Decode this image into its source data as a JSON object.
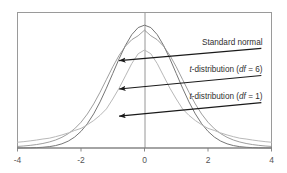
{
  "figure": {
    "title": "",
    "background_color": "#ffffff",
    "frame_color": "#9a9a9a"
  },
  "axis": {
    "x_tick_labels": [
      "-4",
      "-2",
      "0",
      "2",
      "4"
    ],
    "x_tick_values": [
      -4,
      -2,
      0,
      2,
      4
    ],
    "x_label": "",
    "y_label": "",
    "y_ticks_shown": false
  },
  "annotations": [
    {
      "id": "standard-normal",
      "text_parts": [
        {
          "text": "Standard normal",
          "italic": false
        }
      ],
      "plain_text": "Standard normal",
      "arrow_from": [
        0.96,
        0.735
      ],
      "arrow_to": [
        0.4,
        0.645
      ]
    },
    {
      "id": "t-df-6",
      "text_parts": [
        {
          "text": "t",
          "italic": true
        },
        {
          "text": "-distribution (",
          "italic": false
        },
        {
          "text": "df",
          "italic": true
        },
        {
          "text": " = 6)",
          "italic": false
        }
      ],
      "plain_text": "t-distribution (df = 6)",
      "arrow_from": [
        0.96,
        0.535
      ],
      "arrow_to": [
        0.4,
        0.435
      ]
    },
    {
      "id": "t-df-1",
      "text_parts": [
        {
          "text": "t",
          "italic": true
        },
        {
          "text": "-distribution (",
          "italic": false
        },
        {
          "text": "df",
          "italic": true
        },
        {
          "text": " = 1)",
          "italic": false
        }
      ],
      "plain_text": "t-distribution (df = 1)",
      "arrow_from": [
        0.96,
        0.335
      ],
      "arrow_to": [
        0.4,
        0.235
      ]
    }
  ],
  "chart_data": {
    "type": "line",
    "title": "",
    "xlabel": "",
    "ylabel": "",
    "xlim": [
      -4,
      4
    ],
    "ylim": [
      0,
      0.44
    ],
    "grid": false,
    "legend_position": "inline-annotations",
    "x": [
      -4,
      -3.8,
      -3.6,
      -3.4,
      -3.2,
      -3,
      -2.8,
      -2.6,
      -2.4,
      -2.2,
      -2,
      -1.8,
      -1.6,
      -1.4,
      -1.2,
      -1,
      -0.8,
      -0.6,
      -0.4,
      -0.2,
      0,
      0.2,
      0.4,
      0.6,
      0.8,
      1,
      1.2,
      1.4,
      1.6,
      1.8,
      2,
      2.2,
      2.4,
      2.6,
      2.8,
      3,
      3.2,
      3.4,
      3.6,
      3.8,
      4
    ],
    "series": [
      {
        "name": "Standard normal",
        "color": "#6f6f6f",
        "peak": 0.399,
        "values": [
          0.0001,
          0.0003,
          0.0006,
          0.0012,
          0.0024,
          0.0044,
          0.0079,
          0.0136,
          0.0224,
          0.0355,
          0.054,
          0.079,
          0.1109,
          0.1497,
          0.1942,
          0.242,
          0.2897,
          0.3332,
          0.3683,
          0.391,
          0.3989,
          0.391,
          0.3683,
          0.3332,
          0.2897,
          0.242,
          0.1942,
          0.1497,
          0.1109,
          0.079,
          0.054,
          0.0355,
          0.0224,
          0.0136,
          0.0079,
          0.0044,
          0.0024,
          0.0012,
          0.0006,
          0.0003,
          0.0001
        ]
      },
      {
        "name": "t-distribution (df = 6)",
        "color": "#8d8d8d",
        "peak": 0.3827,
        "values": [
          0.0051,
          0.0066,
          0.0086,
          0.0112,
          0.0147,
          0.0195,
          0.0259,
          0.0347,
          0.0466,
          0.0626,
          0.0836,
          0.1104,
          0.1431,
          0.1811,
          0.2223,
          0.2636,
          0.3008,
          0.3306,
          0.3518,
          0.3644,
          0.3827,
          0.3644,
          0.3518,
          0.3306,
          0.3008,
          0.2636,
          0.2223,
          0.1811,
          0.1431,
          0.1104,
          0.0836,
          0.0626,
          0.0466,
          0.0347,
          0.0259,
          0.0195,
          0.0147,
          0.0112,
          0.0086,
          0.0066,
          0.0051
        ]
      },
      {
        "name": "t-distribution (df = 1)",
        "color": "#b8b8b8",
        "peak": 0.3183,
        "values": [
          0.0187,
          0.0207,
          0.0231,
          0.0259,
          0.0292,
          0.0318,
          0.0368,
          0.0424,
          0.049,
          0.0569,
          0.0637,
          0.0756,
          0.0892,
          0.1061,
          0.1268,
          0.1592,
          0.1942,
          0.2342,
          0.2744,
          0.306,
          0.3183,
          0.306,
          0.2744,
          0.2342,
          0.1942,
          0.1592,
          0.1268,
          0.1061,
          0.0892,
          0.0756,
          0.0637,
          0.0569,
          0.049,
          0.0424,
          0.0368,
          0.0318,
          0.0292,
          0.0259,
          0.0231,
          0.0207,
          0.0187
        ]
      }
    ]
  }
}
